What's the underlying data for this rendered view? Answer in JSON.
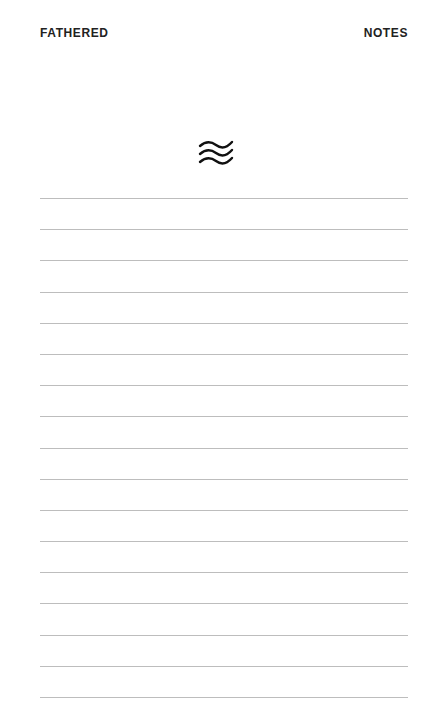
{
  "header": {
    "left_label": "FATHERED",
    "right_label": "NOTES"
  },
  "logo": {
    "icon": "waves-icon"
  },
  "notepad": {
    "line_count": 17,
    "line_color": "#bdbdbd"
  }
}
